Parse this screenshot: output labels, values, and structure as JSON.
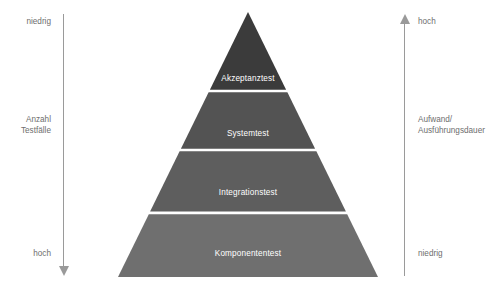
{
  "diagram": {
    "background_color": "#ffffff"
  },
  "axes": {
    "left": {
      "name": "Anzahl Testfaelle",
      "label": "Anzahl Testfälle",
      "top_label": "niedrig",
      "bottom_label": "hoch",
      "direction": "down",
      "color": "#9a9a9a"
    },
    "right": {
      "name": "Aufwand / Ausfuehrungsdauer",
      "label": "Aufwand/\nAusführungsdauer",
      "top_label": "hoch",
      "bottom_label": "niedrig",
      "direction": "up",
      "color": "#9a9a9a"
    }
  },
  "pyramid": {
    "apex_label": "",
    "divider_color": "#ffffff",
    "tiers": [
      {
        "label": "Akzeptanztest",
        "color": "#3b3b3b",
        "text_color": "#ffffff"
      },
      {
        "label": "Systemtest",
        "color": "#535353",
        "text_color": "#ffffff"
      },
      {
        "label": "Integrationstest",
        "color": "#5e5e5e",
        "text_color": "#ffffff"
      },
      {
        "label": "Komponententest",
        "color": "#6f6f6f",
        "text_color": "#ffffff"
      }
    ]
  }
}
